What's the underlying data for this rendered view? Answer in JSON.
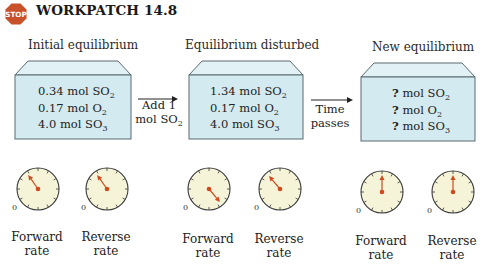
{
  "header": {
    "stop_icon_text": "STOP",
    "title": "WORKPATCH 14.8"
  },
  "stages": [
    {
      "label": "Initial equilibrium",
      "lines": [
        {
          "amount": "0.34 mol SO",
          "sub": "2"
        },
        {
          "amount": "0.17 mol O",
          "sub": "2"
        },
        {
          "amount": "4.0 mol SO",
          "sub": "3"
        }
      ],
      "gauges": [
        {
          "label_1": "Forward",
          "label_2": "rate",
          "zero": "0",
          "needle_angle_deg": -35
        },
        {
          "label_1": "Reverse",
          "label_2": "rate",
          "zero": "0",
          "needle_angle_deg": -35
        }
      ]
    },
    {
      "label": "Equilibrium disturbed",
      "lines": [
        {
          "amount": "1.34 mol SO",
          "sub": "2"
        },
        {
          "amount": "0.17 mol O",
          "sub": "2"
        },
        {
          "amount": "4.0 mol SO",
          "sub": "3"
        }
      ],
      "gauges": [
        {
          "label_1": "Forward",
          "label_2": "rate",
          "zero": "0",
          "needle_angle_deg": 140
        },
        {
          "label_1": "Reverse",
          "label_2": "rate",
          "zero": "0",
          "needle_angle_deg": -40
        }
      ]
    },
    {
      "label": "New equilibrium",
      "lines": [
        {
          "q": "?",
          "amount": " mol SO",
          "sub": "2"
        },
        {
          "q": "?",
          "amount": " mol O",
          "sub": "2"
        },
        {
          "q": "?",
          "amount": " mol SO",
          "sub": "3"
        }
      ],
      "gauges": [
        {
          "label_1": "Forward",
          "label_2": "rate",
          "zero": "0",
          "needle_angle_deg": 0
        },
        {
          "label_1": "Reverse",
          "label_2": "rate",
          "zero": "0",
          "needle_angle_deg": 0
        }
      ]
    }
  ],
  "arrows": [
    {
      "line_1": "Add 1",
      "line_2": "mol SO",
      "sub": "2"
    },
    {
      "line_1": "Time",
      "line_2": "passes"
    }
  ],
  "colors": {
    "stop_fill": "#c8502a",
    "box_front": "#d4eaf1",
    "box_top": "#e2f1f6",
    "box_stroke": "#5a6a70",
    "gauge_fill": "#f6f4d8",
    "gauge_stroke": "#3a3a3a",
    "needle": "#d04a1e"
  }
}
